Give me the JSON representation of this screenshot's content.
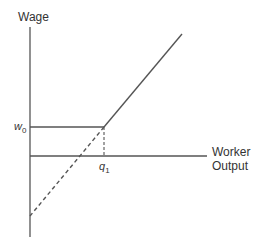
{
  "diagram": {
    "y_axis_label": "Wage",
    "x_axis_label_line1": "Worker",
    "x_axis_label_line2": "Output",
    "wage_marker": {
      "symbol": "w",
      "subscript": "0"
    },
    "output_marker": {
      "symbol": "q",
      "subscript": "1"
    },
    "line_color": "#555555"
  }
}
